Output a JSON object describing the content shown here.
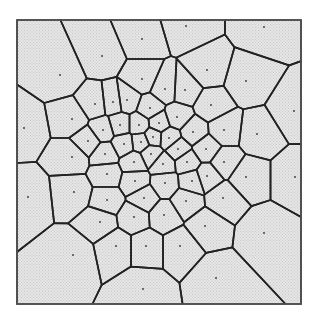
{
  "diagram": {
    "type": "voronoi",
    "frame": {
      "x0": 17,
      "y0": 20,
      "x1": 301,
      "y1": 304
    },
    "colors": {
      "background": "#ffffff",
      "cell_fill": "#e6e6e6",
      "stipple": "#c9c9c9",
      "edge": "#222222",
      "frame": "#555555",
      "site": "#333333"
    },
    "sites": [
      [
        102,
        56
      ],
      [
        186,
        26
      ],
      [
        264,
        27
      ],
      [
        60,
        75
      ],
      [
        142,
        39
      ],
      [
        142,
        79
      ],
      [
        207,
        70
      ],
      [
        246,
        81
      ],
      [
        24,
        128
      ],
      [
        72,
        119
      ],
      [
        95,
        104
      ],
      [
        113,
        102
      ],
      [
        127,
        100
      ],
      [
        150,
        108
      ],
      [
        165,
        89
      ],
      [
        185,
        90
      ],
      [
        211,
        105
      ],
      [
        294,
        111
      ],
      [
        103,
        130
      ],
      [
        120,
        125
      ],
      [
        139,
        125
      ],
      [
        159,
        123
      ],
      [
        177,
        117
      ],
      [
        88,
        141
      ],
      [
        124,
        144
      ],
      [
        141,
        142
      ],
      [
        153,
        137
      ],
      [
        169,
        138
      ],
      [
        193,
        132
      ],
      [
        224,
        130
      ],
      [
        257,
        134
      ],
      [
        105,
        154
      ],
      [
        151,
        154
      ],
      [
        178,
        149
      ],
      [
        206,
        149
      ],
      [
        72,
        157
      ],
      [
        134,
        162
      ],
      [
        163,
        164
      ],
      [
        187,
        162
      ],
      [
        224,
        162
      ],
      [
        107,
        174
      ],
      [
        135,
        181
      ],
      [
        165,
        183
      ],
      [
        192,
        181
      ],
      [
        207,
        176
      ],
      [
        246,
        177
      ],
      [
        295,
        177
      ],
      [
        28,
        197
      ],
      [
        74,
        192
      ],
      [
        107,
        200
      ],
      [
        144,
        198
      ],
      [
        186,
        201
      ],
      [
        223,
        198
      ],
      [
        100,
        222
      ],
      [
        134,
        217
      ],
      [
        164,
        215
      ],
      [
        205,
        226
      ],
      [
        264,
        233
      ],
      [
        73,
        255
      ],
      [
        116,
        246
      ],
      [
        146,
        246
      ],
      [
        180,
        246
      ],
      [
        216,
        278
      ],
      [
        143,
        289
      ]
    ]
  }
}
